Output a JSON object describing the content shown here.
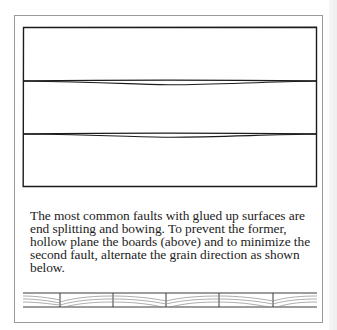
{
  "figure_top": {
    "description": "Three glued-up boards, edges hollow planed",
    "boards": 3,
    "joints": 2
  },
  "caption": {
    "lines": [
      "The most common faults with glued up surfaces are",
      "end splitting and bowing. To prevent the former,",
      "hollow plane the boards (above) and to minimize the",
      "second fault, alternate the grain direction as shown",
      "below."
    ]
  },
  "figure_bottom": {
    "description": "End-grain view of boards with alternating grain direction",
    "segments": 6
  },
  "colors": {
    "frame": "#9a9a9a",
    "ink": "#1c1c1c",
    "grain": "#8a8a8a"
  }
}
